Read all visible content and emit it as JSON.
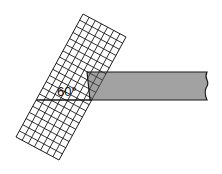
{
  "diagram": {
    "angle_label": "60°",
    "grid_strip": {
      "columns": 7,
      "rows": 20,
      "tilt_degrees": 60,
      "stroke_color": "#1a1a1a",
      "fill_color": "#ffffff"
    },
    "bar": {
      "fill_color": "#9a9a9a",
      "stroke_color": "#1a1a1a",
      "right_edge": "break-line"
    },
    "reference_line": {
      "description": "horizontal baseline through bar bottom"
    }
  }
}
